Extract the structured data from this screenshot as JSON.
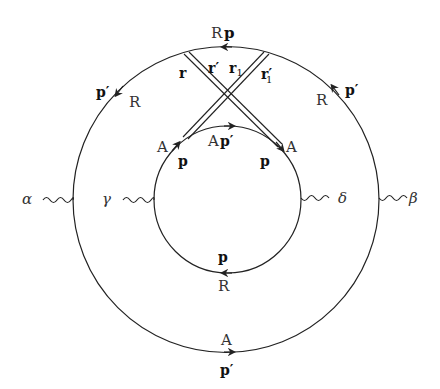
{
  "diagram": {
    "type": "feynman-diagram",
    "outer_loop": {
      "top": {
        "arrow": "left",
        "label_momentum": "p",
        "label_type": "R"
      },
      "upper_left": {
        "arrow": "down-left",
        "label_momentum": "p′",
        "label_type": "R"
      },
      "upper_right": {
        "arrow": "up-left",
        "label_momentum": "p′",
        "label_type": "R"
      },
      "bottom": {
        "arrow": "right",
        "label_momentum": "p′",
        "label_type": "A"
      }
    },
    "inner_loop": {
      "top": {
        "arrow": "right",
        "label_type": "A",
        "label_momentum": "p′"
      },
      "left": {
        "arrow": "up-right",
        "label_type": "A",
        "label_momentum": "p"
      },
      "right": {
        "arrow": "down-right",
        "label_type": "A",
        "label_momentum": "p"
      },
      "bottom": {
        "arrow": "left",
        "label_momentum": "p",
        "label_type": "R"
      }
    },
    "double_lines": {
      "left_line_labels": [
        "r",
        "r′"
      ],
      "right_line_labels": [
        "r",
        "r′"
      ],
      "labels": {
        "r": "r",
        "r_prime": "r′",
        "r1": "r",
        "r1_sub": "1",
        "r1_prime": "r′",
        "r1_prime_sub": "1"
      }
    },
    "external_legs": {
      "alpha": "α",
      "beta": "β",
      "gamma": "γ",
      "delta": "δ"
    },
    "labels": {
      "top_R": "R",
      "top_p": "p",
      "ul_p": "p′",
      "ul_R": "R",
      "ur_R": "R",
      "ur_p": "p′",
      "inner_top_A": "A",
      "inner_top_p": "p′",
      "inner_left_A": "A",
      "inner_left_p": "p",
      "inner_right_A": "A",
      "inner_right_p": "p",
      "inner_bottom_p": "p",
      "inner_bottom_R": "R",
      "outer_bottom_A": "A",
      "outer_bottom_p": "p′"
    },
    "colors": {
      "line": "#222222",
      "text": "#333333",
      "background": "#ffffff"
    }
  }
}
